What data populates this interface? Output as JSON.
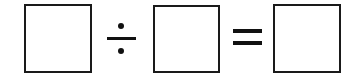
{
  "equation": {
    "operands": [
      {
        "id": "dividend",
        "value": ""
      },
      {
        "id": "divisor",
        "value": ""
      },
      {
        "id": "quotient",
        "value": ""
      }
    ],
    "operators": [
      {
        "symbol": "÷",
        "name": "divide"
      },
      {
        "symbol": "=",
        "name": "equals"
      }
    ]
  },
  "colors": {
    "stroke": "#1a1a1a",
    "background": "#ffffff"
  }
}
